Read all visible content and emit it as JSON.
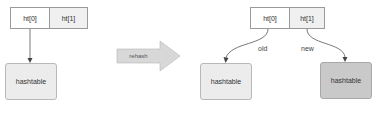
{
  "before": {
    "slots": [
      "ht[0]",
      "ht[1]"
    ],
    "table_label": "hashtable"
  },
  "transition": {
    "label": "rehash"
  },
  "after": {
    "slots": [
      "ht[0]",
      "ht[1]"
    ],
    "old_label": "old",
    "new_label": "new",
    "old_table_label": "hashtable",
    "new_table_label": "hashtable"
  },
  "colors": {
    "cell_border": "#9a9a9a",
    "slot1_fill": "#f0f0f0",
    "table_light": "#ececec",
    "table_dark": "#c9c9c9",
    "arrow": "#555555",
    "rehash_arrow": "#d8d8d8"
  }
}
